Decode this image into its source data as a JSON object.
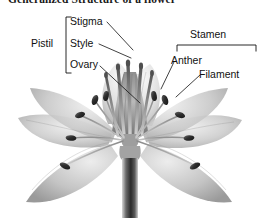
{
  "figure": {
    "title": "Generalized Structure of a flower",
    "style": "grayscale pencil illustration",
    "background_color": "#ffffff",
    "ink_color": "#111111"
  },
  "labels": {
    "pistil": "Pistil",
    "stigma": "Stigma",
    "style": "Style",
    "ovary": "Ovary",
    "stamen": "Stamen",
    "anther": "Anther",
    "filament": "Filament"
  },
  "groups": [
    {
      "name": "Pistil",
      "bracket": "vertical-left",
      "members": [
        "Stigma",
        "Style",
        "Ovary"
      ]
    },
    {
      "name": "Stamen",
      "bracket": "horizontal-top",
      "members": [
        "Anther",
        "Filament"
      ]
    }
  ],
  "callouts": [
    {
      "label": "Stigma",
      "leader": "down-right"
    },
    {
      "label": "Style",
      "leader": "down-right"
    },
    {
      "label": "Ovary",
      "leader": "down-right"
    },
    {
      "label": "Anther",
      "leader": "down-left"
    },
    {
      "label": "Filament",
      "leader": "down-left"
    }
  ]
}
